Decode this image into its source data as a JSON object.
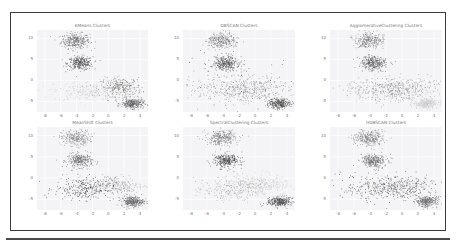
{
  "figure": {
    "layout": "2x3 grid of scatter plots",
    "point_color": "#5a5a5a"
  },
  "chart_data": [
    {
      "type": "scatter",
      "title": "KMeans Clusters",
      "xlabel": "",
      "ylabel": "",
      "xticks": [
        "-8",
        "-6",
        "-4",
        "-2",
        "0",
        "2",
        "4"
      ],
      "yticks": [
        "10",
        "5",
        "0",
        "-5"
      ],
      "xlim": [
        -9,
        5
      ],
      "ylim": [
        -7.5,
        12
      ],
      "grid": true,
      "clusters": [
        {
          "cx": -4.2,
          "cy": 9.5,
          "sx": 0.9,
          "sy": 0.9,
          "n": 320,
          "shade": "#6a6a6a"
        },
        {
          "cx": -3.6,
          "cy": 4.2,
          "sx": 0.8,
          "sy": 0.8,
          "n": 320,
          "shade": "#505050"
        },
        {
          "cx": -2.5,
          "cy": -2.5,
          "sx": 2.2,
          "sy": 1.2,
          "n": 260,
          "shade": "#c4c4c4"
        },
        {
          "cx": 1.6,
          "cy": -1.5,
          "sx": 1.3,
          "sy": 1.1,
          "n": 260,
          "shade": "#6e6e6e"
        },
        {
          "cx": 3.0,
          "cy": -5.4,
          "sx": 0.7,
          "sy": 0.6,
          "n": 300,
          "shade": "#5c5c5c"
        }
      ]
    },
    {
      "type": "scatter",
      "title": "DBSCAN Clusters",
      "xlabel": "",
      "ylabel": "",
      "xticks": [
        "-8",
        "-6",
        "-4",
        "-2",
        "0",
        "2",
        "4"
      ],
      "yticks": [
        "10",
        "5",
        "0",
        "-5"
      ],
      "xlim": [
        -9,
        5
      ],
      "ylim": [
        -7.5,
        12
      ],
      "grid": true,
      "clusters": [
        {
          "cx": -4.2,
          "cy": 9.5,
          "sx": 0.9,
          "sy": 0.9,
          "n": 300,
          "shade": "#7a7a7a"
        },
        {
          "cx": -3.6,
          "cy": 4.2,
          "sx": 0.8,
          "sy": 0.8,
          "n": 320,
          "shade": "#505050"
        },
        {
          "cx": -1.5,
          "cy": -2.2,
          "sx": 3.0,
          "sy": 1.6,
          "n": 480,
          "shade": "#8a8a8a"
        },
        {
          "cx": 3.0,
          "cy": -5.4,
          "sx": 0.7,
          "sy": 0.6,
          "n": 300,
          "shade": "#4e4e4e"
        },
        {
          "cx": -2.0,
          "cy": 1.5,
          "sx": 4.0,
          "sy": 4.5,
          "n": 60,
          "shade": "#3a3a3a"
        }
      ]
    },
    {
      "type": "scatter",
      "title": "AgglomerativeClustering Clusters",
      "xlabel": "",
      "ylabel": "",
      "xticks": [
        "-8",
        "-6",
        "-4",
        "-2",
        "0",
        "2",
        "4"
      ],
      "yticks": [
        "10",
        "5",
        "0",
        "-5"
      ],
      "xlim": [
        -9,
        5
      ],
      "ylim": [
        -7.5,
        12
      ],
      "grid": true,
      "clusters": [
        {
          "cx": -4.2,
          "cy": 9.5,
          "sx": 0.9,
          "sy": 0.9,
          "n": 300,
          "shade": "#7a7a7a"
        },
        {
          "cx": -3.6,
          "cy": 4.2,
          "sx": 0.8,
          "sy": 0.8,
          "n": 320,
          "shade": "#5a5a5a"
        },
        {
          "cx": -1.0,
          "cy": -2.0,
          "sx": 3.0,
          "sy": 1.4,
          "n": 520,
          "shade": "#8c8c8c"
        },
        {
          "cx": 3.0,
          "cy": -5.4,
          "sx": 0.7,
          "sy": 0.6,
          "n": 300,
          "shade": "#c8c8c8"
        }
      ]
    },
    {
      "type": "scatter",
      "title": "MeanShift Clusters",
      "xlabel": "",
      "ylabel": "",
      "xticks": [
        "-8",
        "-6",
        "-4",
        "-2",
        "0",
        "2",
        "4"
      ],
      "yticks": [
        "10",
        "5",
        "0",
        "-5"
      ],
      "xlim": [
        -9,
        5
      ],
      "ylim": [
        -7.5,
        12
      ],
      "grid": true,
      "clusters": [
        {
          "cx": -4.2,
          "cy": 9.5,
          "sx": 0.9,
          "sy": 0.9,
          "n": 300,
          "shade": "#8a8a8a"
        },
        {
          "cx": -3.6,
          "cy": 4.2,
          "sx": 0.8,
          "sy": 0.8,
          "n": 300,
          "shade": "#6a6a6a"
        },
        {
          "cx": -3.0,
          "cy": -2.4,
          "sx": 1.9,
          "sy": 1.3,
          "n": 260,
          "shade": "#2e2e2e"
        },
        {
          "cx": 0.8,
          "cy": -1.6,
          "sx": 1.8,
          "sy": 1.2,
          "n": 260,
          "shade": "#a0a0a0"
        },
        {
          "cx": 3.0,
          "cy": -5.4,
          "sx": 0.7,
          "sy": 0.6,
          "n": 300,
          "shade": "#5e5e5e"
        }
      ]
    },
    {
      "type": "scatter",
      "title": "SpectralClustering Clusters",
      "xlabel": "",
      "ylabel": "",
      "xticks": [
        "-8",
        "-6",
        "-4",
        "-2",
        "0",
        "2",
        "4"
      ],
      "yticks": [
        "10",
        "5",
        "0",
        "-5"
      ],
      "xlim": [
        -9,
        5
      ],
      "ylim": [
        -7.5,
        12
      ],
      "grid": true,
      "clusters": [
        {
          "cx": -4.2,
          "cy": 9.5,
          "sx": 0.9,
          "sy": 0.9,
          "n": 300,
          "shade": "#7a7a7a"
        },
        {
          "cx": -3.6,
          "cy": 4.2,
          "sx": 0.8,
          "sy": 0.8,
          "n": 320,
          "shade": "#4a4a4a"
        },
        {
          "cx": -2.6,
          "cy": -2.4,
          "sx": 2.0,
          "sy": 1.3,
          "n": 260,
          "shade": "#9a9a9a"
        },
        {
          "cx": 1.0,
          "cy": -1.6,
          "sx": 1.6,
          "sy": 1.2,
          "n": 260,
          "shade": "#c6c6c6"
        },
        {
          "cx": 3.0,
          "cy": -5.4,
          "sx": 0.7,
          "sy": 0.6,
          "n": 300,
          "shade": "#4a4a4a"
        }
      ]
    },
    {
      "type": "scatter",
      "title": "HDBSCAN Clusters",
      "xlabel": "",
      "ylabel": "",
      "xticks": [
        "-8",
        "-6",
        "-4",
        "-2",
        "0",
        "2",
        "4"
      ],
      "yticks": [
        "10",
        "5",
        "0",
        "-5"
      ],
      "xlim": [
        -9,
        5
      ],
      "ylim": [
        -7.5,
        12
      ],
      "grid": true,
      "clusters": [
        {
          "cx": -4.2,
          "cy": 9.5,
          "sx": 0.9,
          "sy": 0.9,
          "n": 300,
          "shade": "#7a7a7a"
        },
        {
          "cx": -3.6,
          "cy": 4.2,
          "sx": 0.8,
          "sy": 0.8,
          "n": 300,
          "shade": "#6a6a6a"
        },
        {
          "cx": -1.5,
          "cy": -2.2,
          "sx": 3.0,
          "sy": 1.5,
          "n": 420,
          "shade": "#3a3a3a"
        },
        {
          "cx": 0.5,
          "cy": -1.8,
          "sx": 1.4,
          "sy": 1.0,
          "n": 160,
          "shade": "#c8c8c8"
        },
        {
          "cx": 3.0,
          "cy": -5.4,
          "sx": 0.7,
          "sy": 0.6,
          "n": 300,
          "shade": "#6a6a6a"
        }
      ]
    }
  ]
}
